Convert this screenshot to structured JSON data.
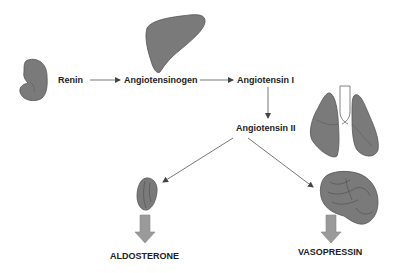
{
  "diagram": {
    "title": "",
    "nodes": {
      "renin": "Renin",
      "angiotensinogen": "Angiotensinogen",
      "angiotensin1": "Angiotensin I",
      "angiotensin2": "Angiotensin II",
      "aldosterone": "ALDOSTERONE",
      "vasopressin": "VASOPRESSIN"
    },
    "organs": [
      "kidney",
      "liver",
      "lungs",
      "adrenal-gland",
      "brain"
    ],
    "edges": [
      {
        "from": "renin",
        "to": "angiotensinogen"
      },
      {
        "from": "angiotensinogen",
        "to": "angiotensin1"
      },
      {
        "from": "angiotensin1",
        "to": "angiotensin2"
      },
      {
        "from": "angiotensin2",
        "to": "adrenal-gland"
      },
      {
        "from": "angiotensin2",
        "to": "brain"
      },
      {
        "from": "adrenal-gland",
        "to": "aldosterone"
      },
      {
        "from": "brain",
        "to": "vasopressin"
      }
    ],
    "colors": {
      "organ_fill": "#7a7a7a",
      "organ_stroke": "#444444",
      "arrow": "#555555",
      "block_arrow": "#9a9a9a",
      "text": "#222222"
    }
  }
}
